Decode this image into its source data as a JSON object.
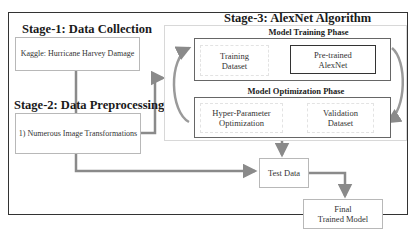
{
  "stage1": {
    "title": "Stage-1: Data Collection",
    "box": "Kaggle: Hurricane Harvey Damage"
  },
  "stage2": {
    "title": "Stage-2: Data Preprocessing",
    "box": "1) Numerous Image Transformations"
  },
  "stage3": {
    "title": "Stage-3: AlexNet Algorithm",
    "training_phase": {
      "title": "Model Training Phase",
      "left_box": [
        "Training",
        "Dataset"
      ],
      "right_box": [
        "Pre-trained",
        "AlexNet"
      ]
    },
    "optimization_phase": {
      "title": "Model Optimization Phase",
      "left_box": [
        "Hyper-Parameter",
        "Optimization"
      ],
      "right_box": [
        "Validation",
        "Dataset"
      ]
    }
  },
  "test_data": "Test Data",
  "final_model": [
    "Final",
    "Trained Model"
  ],
  "colors": {
    "arrow": "#8a8a8a",
    "border": "#333333",
    "box_border": "#b8b8b8"
  }
}
